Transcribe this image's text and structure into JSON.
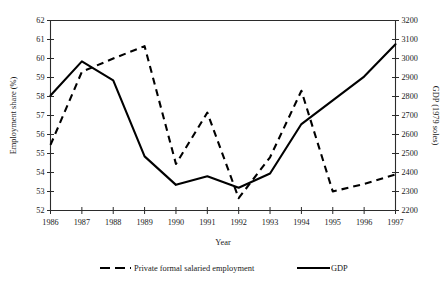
{
  "chart_data": {
    "type": "line",
    "title": "",
    "xlabel": "Year",
    "ylabel": "Employment share (%)",
    "y2label": "GDP (1979 soles)",
    "categories": [
      1986,
      1987,
      1988,
      1989,
      1990,
      1991,
      1992,
      1993,
      1994,
      1995,
      1996,
      1997
    ],
    "x_tick_labels": [
      "1986",
      "1987",
      "1988",
      "1989",
      "1990",
      "1991",
      "1992",
      "1993",
      "1994",
      "1995",
      "1996",
      "1997"
    ],
    "xlim": [
      1986,
      1997
    ],
    "ylim": [
      52,
      62
    ],
    "y_tick_labels": [
      "52",
      "53",
      "54",
      "55",
      "56",
      "57",
      "58",
      "59",
      "60",
      "61",
      "62"
    ],
    "y_ticks": [
      52,
      53,
      54,
      55,
      56,
      57,
      58,
      59,
      60,
      61,
      62
    ],
    "y2lim": [
      2200,
      3200
    ],
    "y2_tick_labels": [
      "2200",
      "2300",
      "2400",
      "2500",
      "2600",
      "2700",
      "2800",
      "2900",
      "3000",
      "3100",
      "3200"
    ],
    "y2_ticks": [
      2200,
      2300,
      2400,
      2500,
      2600,
      2700,
      2800,
      2900,
      3000,
      3100,
      3200
    ],
    "grid": false,
    "legend_position": "bottom",
    "series": [
      {
        "name": "Private formal salaried employment",
        "axis": "left",
        "style": "dashed",
        "values": [
          55.45,
          59.3,
          60.0,
          60.65,
          54.45,
          57.15,
          52.65,
          54.8,
          58.3,
          53.0,
          53.4,
          53.9
        ]
      },
      {
        "name": "GDP",
        "axis": "right",
        "style": "solid",
        "values": [
          2805,
          2985,
          2885,
          2485,
          2335,
          2380,
          2320,
          2395,
          2655,
          2780,
          2905,
          3075
        ]
      }
    ]
  },
  "legend": {
    "items": [
      {
        "label": "Private formal salaried employment",
        "style": "dashed"
      },
      {
        "label": "GDP",
        "style": "solid"
      }
    ]
  }
}
